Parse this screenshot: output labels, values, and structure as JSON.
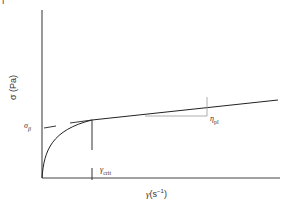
{
  "diagram": {
    "type": "rheology-flow-curve",
    "y_axis": {
      "label": "σ (Pa)"
    },
    "x_axis": {
      "label_symbol": "γ",
      "label_unit": "(s",
      "label_exp": "−1",
      "label_close": ")"
    },
    "annotations": {
      "yield_stress": {
        "symbol": "σ",
        "sub": "β"
      },
      "critical_shear_rate": {
        "symbol": "γ",
        "sub": "crit"
      },
      "plastic_viscosity": {
        "symbol": "η",
        "sub": "pl"
      }
    },
    "top_mark": "|",
    "colors": {
      "line": "#222222",
      "triangle": "#888888",
      "text": "#333333"
    }
  }
}
